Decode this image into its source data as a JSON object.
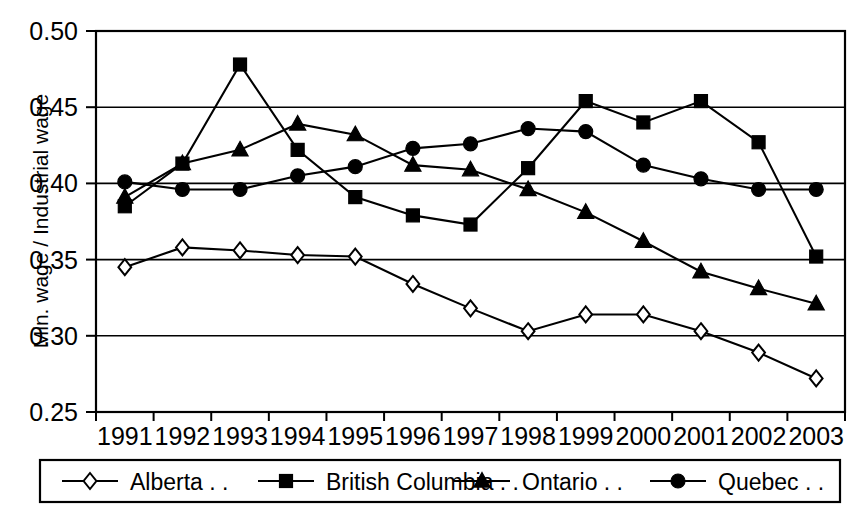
{
  "chart_data": {
    "type": "line",
    "title": "",
    "subtitle": "",
    "xlabel": "",
    "ylabel": "Min. wage / Industrial wage",
    "categories": [
      "1991",
      "1992",
      "1993",
      "1994",
      "1995",
      "1996",
      "1997",
      "1998",
      "1999",
      "2000",
      "2001",
      "2002",
      "2003"
    ],
    "x": [
      1991,
      1992,
      1993,
      1994,
      1995,
      1996,
      1997,
      1998,
      1999,
      2000,
      2001,
      2002,
      2003
    ],
    "ylim": [
      0.25,
      0.5
    ],
    "yticks": [
      0.25,
      0.3,
      0.35,
      0.4,
      0.45,
      0.5
    ],
    "ytick_labels": [
      "0.25",
      "0.30",
      "0.35",
      "0.40",
      "0.45",
      "0.50"
    ],
    "grid": "horizontal",
    "legend_position": "bottom",
    "series": [
      {
        "name": "Alberta . .",
        "marker": "open-diamond",
        "color": "#000000",
        "values": [
          0.345,
          0.358,
          0.356,
          0.353,
          0.352,
          0.334,
          0.318,
          0.303,
          0.314,
          0.314,
          0.303,
          0.289,
          0.272
        ]
      },
      {
        "name": "British Columbia . .",
        "marker": "filled-square",
        "color": "#000000",
        "values": [
          0.385,
          0.413,
          0.478,
          0.422,
          0.391,
          0.379,
          0.373,
          0.41,
          0.454,
          0.44,
          0.454,
          0.427,
          0.352
        ]
      },
      {
        "name": "Ontario . .",
        "marker": "filled-triangle",
        "color": "#000000",
        "values": [
          0.391,
          0.413,
          0.422,
          0.439,
          0.432,
          0.412,
          0.409,
          0.396,
          0.381,
          0.362,
          0.342,
          0.331,
          0.321
        ]
      },
      {
        "name": "Quebec . .",
        "marker": "filled-circle",
        "color": "#000000",
        "values": [
          0.401,
          0.396,
          0.396,
          0.405,
          0.411,
          0.423,
          0.426,
          0.436,
          0.434,
          0.412,
          0.403,
          0.396,
          0.396
        ]
      }
    ]
  },
  "axes": {
    "y_title": "Min. wage / Industrial wage",
    "y_tick_labels": [
      "0.50",
      "0.45",
      "0.40",
      "0.35",
      "0.30",
      "0.25"
    ],
    "x_tick_labels": [
      "1991",
      "1992",
      "1993",
      "1994",
      "1995",
      "1996",
      "1997",
      "1998",
      "1999",
      "2000",
      "2001",
      "2002",
      "2003"
    ]
  },
  "legend": {
    "entries": [
      {
        "label": "Alberta . .",
        "marker": "open-diamond"
      },
      {
        "label": "British Columbia . .",
        "marker": "filled-square"
      },
      {
        "label": "Ontario . .",
        "marker": "filled-triangle"
      },
      {
        "label": "Quebec . .",
        "marker": "filled-circle"
      }
    ]
  },
  "colors": {
    "ink": "#000000",
    "paper": "#ffffff"
  }
}
